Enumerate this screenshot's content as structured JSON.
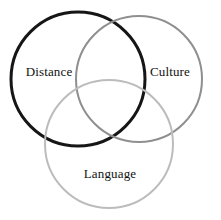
{
  "figure": {
    "type": "venn-diagram",
    "background_color": "#ffffff",
    "width": 221,
    "height": 220,
    "set_count": 3
  },
  "chart_data": {
    "type": "venn",
    "title": "",
    "sets": [
      {
        "id": "distance",
        "label": "Distance",
        "stroke_color": "#161616",
        "stroke_width": 3,
        "fill": "none",
        "center_x": 78,
        "center_y": 79,
        "radius": 67,
        "label_x": 49,
        "label_y": 71
      },
      {
        "id": "culture",
        "label": "Culture",
        "stroke_color": "#8f8f8f",
        "stroke_width": 2,
        "fill": "none",
        "center_x": 139,
        "center_y": 79,
        "radius": 63,
        "label_x": 170,
        "label_y": 71
      },
      {
        "id": "language",
        "label": "Language",
        "stroke_color": "#bcbcbc",
        "stroke_width": 2,
        "fill": "none",
        "center_x": 109,
        "center_y": 144,
        "radius": 64,
        "label_x": 110,
        "label_y": 173
      }
    ],
    "overlaps": [
      {
        "sets": [
          "distance",
          "culture"
        ],
        "label": ""
      },
      {
        "sets": [
          "distance",
          "language"
        ],
        "label": ""
      },
      {
        "sets": [
          "culture",
          "language"
        ],
        "label": ""
      },
      {
        "sets": [
          "distance",
          "culture",
          "language"
        ],
        "label": ""
      }
    ],
    "legend": "none",
    "grid": false
  }
}
